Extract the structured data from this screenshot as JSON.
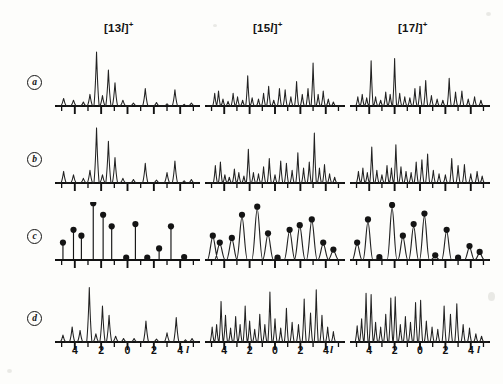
{
  "figure": {
    "title_columns": [
      {
        "id": "col-13l",
        "prefix": "[",
        "number": "13",
        "variable": "l",
        "suffix": "]",
        "charge": "+",
        "full": "[13l]+"
      },
      {
        "id": "col-15l",
        "prefix": "[",
        "number": "15",
        "variable": "l",
        "suffix": "]",
        "charge": "+",
        "full": "[15l]+"
      },
      {
        "id": "col-17l",
        "prefix": "[",
        "number": "17",
        "variable": "l",
        "suffix": "]",
        "charge": "+",
        "full": "[17l]+"
      }
    ],
    "row_labels": [
      "a",
      "b",
      "c",
      "d"
    ],
    "axis": {
      "variable": "l",
      "tick_labels": [
        "4",
        "2",
        "0",
        "2",
        "4"
      ],
      "tick_values": [
        -4,
        -2,
        0,
        2,
        4
      ],
      "range": [
        -5.2,
        5.2
      ],
      "minor_tick_step": 1
    },
    "marker_color": "#141414",
    "trace_color": "#222222",
    "axis_color": "#111111"
  },
  "chart_data": [
    {
      "id": "a-13l",
      "type": "line",
      "panel_row": "a",
      "panel_col": "[13l]+",
      "title": "",
      "xlabel": "l",
      "ylabel": "",
      "xlim": [
        -5.2,
        5.2
      ],
      "ylim": [
        0,
        1.0
      ],
      "grid": false,
      "legend": null,
      "style": "stick-profile",
      "x": [
        -4.85,
        -4.1,
        -3.35,
        -2.85,
        -2.35,
        -1.9,
        -1.45,
        -0.95,
        -0.35,
        0.45,
        1.35,
        2.2,
        3.0,
        3.6,
        4.3,
        4.85
      ],
      "y": [
        0.13,
        0.1,
        0.07,
        0.2,
        0.93,
        0.18,
        0.62,
        0.4,
        0.1,
        0.05,
        0.3,
        0.06,
        0.04,
        0.28,
        0.03,
        0.05
      ]
    },
    {
      "id": "a-15l",
      "type": "line",
      "panel_row": "a",
      "panel_col": "[15l]+",
      "title": "",
      "xlabel": "l",
      "ylabel": "",
      "xlim": [
        -5.2,
        5.2
      ],
      "ylim": [
        0,
        1.0
      ],
      "grid": false,
      "legend": null,
      "style": "stick-profile",
      "x": [
        -4.75,
        -4.45,
        -4.1,
        -3.7,
        -3.3,
        -2.95,
        -2.55,
        -2.15,
        -1.8,
        -1.3,
        -0.9,
        -0.5,
        -0.1,
        0.35,
        0.8,
        1.25,
        1.7,
        2.15,
        2.6,
        3.0,
        3.4,
        3.8,
        4.2,
        4.6
      ],
      "y": [
        0.22,
        0.26,
        0.12,
        0.08,
        0.22,
        0.16,
        0.1,
        0.52,
        0.14,
        0.12,
        0.22,
        0.34,
        0.1,
        0.3,
        0.28,
        0.16,
        0.42,
        0.2,
        0.3,
        0.74,
        0.2,
        0.26,
        0.12,
        0.07
      ]
    },
    {
      "id": "a-17l",
      "type": "line",
      "panel_row": "a",
      "panel_col": "[17l]+",
      "title": "",
      "xlabel": "l",
      "ylabel": "",
      "xlim": [
        -5.2,
        5.2
      ],
      "ylim": [
        0,
        1.0
      ],
      "grid": false,
      "legend": null,
      "style": "stick-profile",
      "x": [
        -4.9,
        -4.55,
        -4.2,
        -3.85,
        -3.5,
        -3.1,
        -2.7,
        -2.35,
        -2.0,
        -1.6,
        -1.2,
        -0.8,
        -0.4,
        0.0,
        0.45,
        0.9,
        1.35,
        1.8,
        2.3,
        2.8,
        3.3,
        3.8,
        4.3,
        4.8
      ],
      "y": [
        0.16,
        0.2,
        0.14,
        0.78,
        0.16,
        0.1,
        0.24,
        0.2,
        0.82,
        0.22,
        0.16,
        0.14,
        0.3,
        0.34,
        0.44,
        0.18,
        0.12,
        0.1,
        0.48,
        0.24,
        0.26,
        0.12,
        0.16,
        0.1
      ]
    },
    {
      "id": "b-13l",
      "type": "line",
      "panel_row": "b",
      "panel_col": "[13l]+",
      "title": "",
      "xlabel": "l",
      "ylabel": "",
      "xlim": [
        -5.2,
        5.2
      ],
      "ylim": [
        0,
        1.0
      ],
      "grid": false,
      "legend": null,
      "style": "stick-profile",
      "x": [
        -4.85,
        -4.1,
        -3.35,
        -2.85,
        -2.35,
        -1.9,
        -1.45,
        -0.95,
        -0.35,
        0.45,
        1.35,
        2.2,
        3.0,
        3.6,
        4.3,
        4.85
      ],
      "y": [
        0.2,
        0.14,
        0.08,
        0.22,
        0.95,
        0.14,
        0.72,
        0.44,
        0.08,
        0.06,
        0.34,
        0.05,
        0.18,
        0.38,
        0.04,
        0.06
      ]
    },
    {
      "id": "b-15l",
      "type": "line",
      "panel_row": "b",
      "panel_col": "[15l]+",
      "title": "",
      "xlabel": "l",
      "ylabel": "",
      "xlim": [
        -5.2,
        5.2
      ],
      "ylim": [
        0,
        1.0
      ],
      "grid": false,
      "legend": null,
      "style": "stick-profile",
      "x": [
        -4.7,
        -4.3,
        -3.95,
        -3.6,
        -3.2,
        -2.85,
        -2.45,
        -2.1,
        -1.7,
        -1.3,
        -0.9,
        -0.45,
        0.0,
        0.45,
        0.9,
        1.35,
        1.8,
        2.25,
        2.7,
        3.1,
        3.5,
        3.9,
        4.3,
        4.7
      ],
      "y": [
        0.3,
        0.36,
        0.14,
        0.1,
        0.24,
        0.18,
        0.12,
        0.58,
        0.18,
        0.16,
        0.28,
        0.42,
        0.14,
        0.38,
        0.34,
        0.22,
        0.52,
        0.26,
        0.36,
        0.86,
        0.26,
        0.32,
        0.16,
        0.1
      ]
    },
    {
      "id": "b-17l",
      "type": "line",
      "panel_row": "b",
      "panel_col": "[17l]+",
      "title": "",
      "xlabel": "l",
      "ylabel": "",
      "xlim": [
        -5.2,
        5.2
      ],
      "ylim": [
        0,
        1.0
      ],
      "grid": false,
      "legend": null,
      "style": "stick-profile",
      "x": [
        -4.85,
        -4.5,
        -4.15,
        -3.8,
        -3.4,
        -3.0,
        -2.6,
        -2.25,
        -1.9,
        -1.5,
        -1.1,
        -0.7,
        -0.3,
        0.15,
        0.6,
        1.05,
        1.5,
        2.0,
        2.5,
        3.0,
        3.5,
        4.0,
        4.5,
        4.9
      ],
      "y": [
        0.2,
        0.26,
        0.18,
        0.62,
        0.22,
        0.14,
        0.3,
        0.26,
        0.66,
        0.28,
        0.2,
        0.18,
        0.36,
        0.4,
        0.5,
        0.22,
        0.16,
        0.14,
        0.42,
        0.3,
        0.32,
        0.16,
        0.2,
        0.12
      ]
    },
    {
      "id": "c-13l",
      "type": "scatter",
      "panel_row": "c",
      "panel_col": "[13l]+",
      "title": "",
      "xlabel": "l",
      "ylabel": "",
      "xlim": [
        -5.2,
        5.2
      ],
      "ylim": [
        0,
        1.0
      ],
      "grid": false,
      "legend": null,
      "style": "stem-with-markers",
      "x": [
        -4.9,
        -4.1,
        -3.5,
        -2.6,
        -1.85,
        -1.2,
        -0.1,
        0.6,
        1.5,
        2.4,
        3.3,
        4.3
      ],
      "y": [
        0.3,
        0.52,
        0.42,
        0.98,
        0.78,
        0.58,
        0.04,
        0.62,
        0.04,
        0.2,
        0.58,
        0.05
      ]
    },
    {
      "id": "c-15l",
      "type": "scatter",
      "panel_row": "c",
      "panel_col": "[15l]+",
      "title": "",
      "xlabel": "l",
      "ylabel": "",
      "xlim": [
        -5.2,
        5.2
      ],
      "ylim": [
        0,
        1.0
      ],
      "grid": false,
      "legend": null,
      "style": "stem-with-markers-and-trace",
      "x": [
        -4.9,
        -4.35,
        -3.4,
        -2.6,
        -1.4,
        -0.55,
        0.2,
        1.15,
        1.95,
        2.9,
        3.8,
        4.6
      ],
      "y": [
        0.42,
        0.3,
        0.38,
        0.78,
        0.92,
        0.46,
        0.04,
        0.52,
        0.6,
        0.7,
        0.3,
        0.18
      ],
      "trace_x": [
        -4.9,
        -4.35,
        -3.4,
        -2.6,
        -1.4,
        -0.55,
        0.2,
        1.15,
        1.95,
        2.9,
        3.8,
        4.6
      ],
      "trace_y": [
        0.4,
        0.28,
        0.36,
        0.74,
        0.88,
        0.44,
        0.03,
        0.5,
        0.58,
        0.68,
        0.28,
        0.16
      ]
    },
    {
      "id": "c-17l",
      "type": "scatter",
      "panel_row": "c",
      "panel_col": "[17l]+",
      "title": "",
      "xlabel": "l",
      "ylabel": "",
      "xlim": [
        -5.2,
        5.2
      ],
      "ylim": [
        0,
        1.0
      ],
      "grid": false,
      "legend": null,
      "style": "stem-with-markers-and-trace",
      "x": [
        -4.95,
        -4.1,
        -3.2,
        -2.2,
        -1.35,
        -0.5,
        0.35,
        1.2,
        2.1,
        3.0,
        3.9,
        4.7
      ],
      "y": [
        0.3,
        0.7,
        0.05,
        0.95,
        0.42,
        0.62,
        0.8,
        0.08,
        0.52,
        0.04,
        0.24,
        0.14
      ],
      "trace_x": [
        -4.95,
        -4.1,
        -3.2,
        -2.2,
        -1.35,
        -0.5,
        0.35,
        1.2,
        2.1,
        3.0,
        3.9,
        4.7
      ],
      "trace_y": [
        0.28,
        0.66,
        0.04,
        0.9,
        0.4,
        0.58,
        0.76,
        0.06,
        0.5,
        0.03,
        0.22,
        0.12
      ]
    },
    {
      "id": "d-13l",
      "type": "line",
      "panel_row": "d",
      "panel_col": "[13l]+",
      "title": "",
      "xlabel": "l",
      "ylabel": "",
      "xlim": [
        -5.2,
        5.2
      ],
      "ylim": [
        0,
        1.0
      ],
      "grid": false,
      "legend": null,
      "style": "stick-profile",
      "x": [
        -4.9,
        -4.2,
        -3.6,
        -2.9,
        -2.4,
        -1.9,
        -1.4,
        -0.9,
        -0.3,
        0.5,
        1.4,
        2.2,
        3.0,
        3.7,
        4.4,
        4.9
      ],
      "y": [
        0.12,
        0.26,
        0.2,
        0.94,
        0.14,
        0.62,
        0.46,
        0.1,
        0.06,
        0.06,
        0.36,
        0.05,
        0.16,
        0.42,
        0.04,
        0.06
      ]
    },
    {
      "id": "d-15l",
      "type": "line",
      "panel_row": "d",
      "panel_col": "[15l]+",
      "title": "",
      "xlabel": "l",
      "ylabel": "",
      "xlim": [
        -5.2,
        5.2
      ],
      "ylim": [
        0,
        1.0
      ],
      "grid": false,
      "legend": null,
      "style": "stick-profile",
      "x": [
        -4.95,
        -4.6,
        -4.25,
        -3.9,
        -3.5,
        -3.1,
        -2.75,
        -2.35,
        -2.0,
        -1.6,
        -1.2,
        -0.8,
        -0.4,
        0.0,
        0.45,
        0.9,
        1.35,
        1.85,
        2.3,
        2.8,
        3.25,
        3.7,
        4.15,
        4.6
      ],
      "y": [
        0.26,
        0.3,
        0.7,
        0.46,
        0.24,
        0.44,
        0.3,
        0.62,
        0.36,
        0.22,
        0.48,
        0.3,
        0.86,
        0.4,
        0.24,
        0.58,
        0.34,
        0.3,
        0.74,
        0.5,
        0.9,
        0.46,
        0.26,
        0.18
      ]
    },
    {
      "id": "d-17l",
      "type": "line",
      "panel_row": "d",
      "panel_col": "[17l]+",
      "title": "",
      "xlabel": "l",
      "ylabel": "",
      "xlim": [
        -5.2,
        5.2
      ],
      "ylim": [
        0,
        1.0
      ],
      "grid": false,
      "legend": null,
      "style": "stick-profile",
      "x": [
        -4.95,
        -4.6,
        -4.25,
        -3.85,
        -3.5,
        -3.1,
        -2.7,
        -2.3,
        -1.95,
        -1.55,
        -1.15,
        -0.75,
        -0.35,
        0.05,
        0.5,
        0.95,
        1.4,
        1.9,
        2.4,
        2.9,
        3.4,
        3.9,
        4.4,
        4.85
      ],
      "y": [
        0.28,
        0.4,
        0.84,
        0.82,
        0.34,
        0.26,
        0.48,
        0.76,
        0.78,
        0.3,
        0.44,
        0.34,
        0.68,
        0.72,
        0.36,
        0.26,
        0.22,
        0.62,
        0.48,
        0.66,
        0.3,
        0.24,
        0.14,
        0.1
      ]
    }
  ]
}
